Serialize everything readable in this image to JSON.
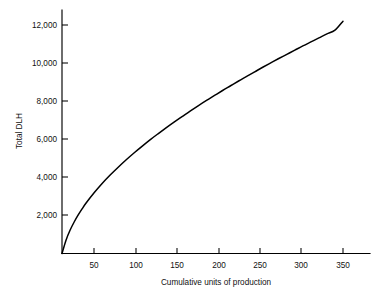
{
  "chart_data": {
    "type": "line",
    "title": "",
    "xlabel": "Cumulative units of production",
    "ylabel": "Total DLH",
    "xlim": [
      0,
      365
    ],
    "ylim": [
      0,
      12800
    ],
    "grid": false,
    "legend": "none",
    "xticks": [
      50,
      100,
      150,
      200,
      250,
      300,
      350
    ],
    "xtick_labels": [
      "50",
      "100",
      "150",
      "200",
      "250",
      "300",
      "350"
    ],
    "yticks": [
      2000,
      4000,
      6000,
      8000,
      10000,
      12000
    ],
    "ytick_labels": [
      "2,000",
      "4,000",
      "6,000",
      "8,000",
      "10,000",
      "12,000"
    ],
    "series": [
      {
        "name": "Total DLH",
        "x": [
          0,
          5,
          10,
          15,
          20,
          25,
          30,
          40,
          50,
          60,
          70,
          80,
          90,
          100,
          110,
          120,
          130,
          140,
          150,
          160,
          170,
          180,
          190,
          200,
          210,
          220,
          230,
          240,
          250,
          260,
          270,
          280,
          290,
          300,
          310,
          320,
          330,
          340,
          350
        ],
        "y": [
          0,
          700,
          1220,
          1640,
          2010,
          2340,
          2650,
          3190,
          3680,
          4120,
          4530,
          4920,
          5290,
          5640,
          5980,
          6300,
          6610,
          6910,
          7200,
          7490,
          7770,
          8040,
          8300,
          8560,
          8810,
          9060,
          9300,
          9540,
          9780,
          10010,
          10240,
          10460,
          10680,
          10900,
          11110,
          11320,
          11530,
          11730,
          12200
        ]
      }
    ],
    "annotations": []
  },
  "axis": {
    "y_title": "Total DLH",
    "x_title": "Cumulative units of production"
  },
  "caption": {
    "partial_text": ""
  }
}
